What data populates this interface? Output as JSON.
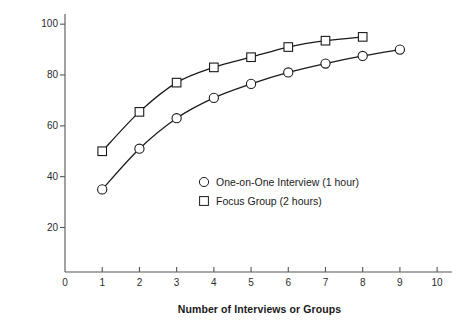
{
  "chart_data": {
    "type": "line",
    "title": "",
    "subtitle": "",
    "xlabel": "Number of Interviews or Groups",
    "ylabel": "Percent of Needs Identified",
    "xlim": [
      0,
      10.4
    ],
    "ylim": [
      2.5,
      104
    ],
    "xticks": [
      0,
      1,
      2,
      3,
      4,
      5,
      6,
      7,
      8,
      9,
      10
    ],
    "xticklabels": [
      "0",
      "1",
      "2",
      "3",
      "4",
      "5",
      "6",
      "7",
      "8",
      "9",
      "10"
    ],
    "yticks": [
      20,
      40,
      60,
      80,
      100
    ],
    "yticklabels": [
      "20",
      "40",
      "60",
      "80",
      "100"
    ],
    "grid": false,
    "legend_position": "inside-center",
    "series": [
      {
        "name": "One-on-One Interview (1 hour)",
        "marker": "circle",
        "color": "#1a1a1a",
        "x": [
          1,
          2,
          3,
          4,
          5,
          6,
          7,
          8,
          9
        ],
        "values": [
          35,
          51,
          63,
          71,
          76.5,
          81,
          84.5,
          87.5,
          90
        ]
      },
      {
        "name": "Focus Group (2 hours)",
        "marker": "square",
        "color": "#1a1a1a",
        "x": [
          1,
          2,
          3,
          4,
          5,
          6,
          7,
          8
        ],
        "values": [
          50,
          65.5,
          77,
          83,
          87,
          91,
          93.5,
          95
        ]
      }
    ]
  },
  "legend": {
    "items": [
      {
        "label": "One-on-One Interview (1 hour)",
        "marker": "circle-marker-icon"
      },
      {
        "label": "Focus Group (2 hours)",
        "marker": "square-marker-icon"
      }
    ]
  },
  "colors": {
    "ink": "#1a1a1a",
    "axis": "#555555",
    "background": "#ffffff"
  }
}
